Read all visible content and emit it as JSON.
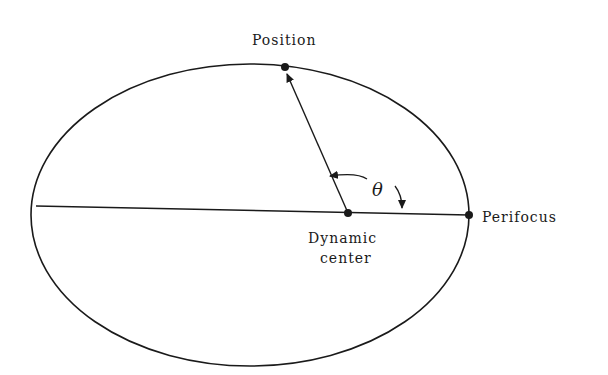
{
  "diagram": {
    "type": "orbit-ellipse",
    "labels": {
      "position": "Position",
      "perifocus": "Perifocus",
      "dynamic_center_line1": "Dynamic",
      "dynamic_center_line2": "center",
      "angle": "θ"
    },
    "colors": {
      "stroke": "#1a1a1a",
      "background": "#ffffff"
    }
  }
}
